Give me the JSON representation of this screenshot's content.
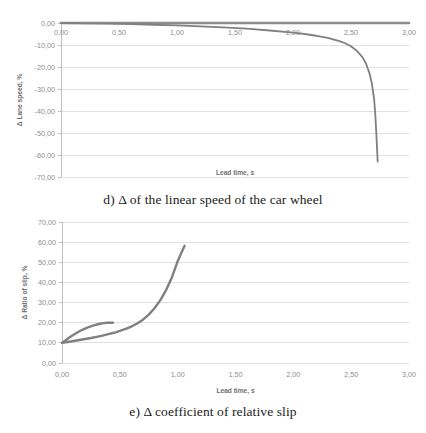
{
  "figures": [
    {
      "id": "d",
      "caption": "d) Δ of the linear speed of the car wheel",
      "chart_data": {
        "type": "line",
        "title": "",
        "xlabel": "Lead time, s",
        "ylabel": "Δ Lane speed, %",
        "xlim": [
          0.0,
          3.0
        ],
        "ylim": [
          -70.0,
          0.0
        ],
        "xticks": [
          "0,00",
          "0,50",
          "1,00",
          "1,50",
          "2,00",
          "2,50",
          "3,00"
        ],
        "xtick_values": [
          0.0,
          0.5,
          1.0,
          1.5,
          2.0,
          2.5,
          3.0
        ],
        "yticks": [
          "0,00",
          "-10,00",
          "-20,00",
          "-30,00",
          "-40,00",
          "-50,00",
          "-60,00",
          "-70,00"
        ],
        "ytick_values": [
          0,
          -10,
          -20,
          -30,
          -40,
          -50,
          -60,
          -70
        ],
        "grid": true,
        "legend": "none",
        "series": [
          {
            "name": "reference",
            "color": "#8c8c8c",
            "width": 2.6,
            "x": [
              0.0,
              0.5,
              1.0,
              1.5,
              2.0,
              2.5,
              3.0
            ],
            "values": [
              0.0,
              0.0,
              0.0,
              0.0,
              0.0,
              0.0,
              0.0
            ]
          },
          {
            "name": "wheel linear speed delta",
            "color": "#808080",
            "width": 1.8,
            "x": [
              0.0,
              0.2,
              0.4,
              0.6,
              0.8,
              1.0,
              1.2,
              1.4,
              1.6,
              1.8,
              2.0,
              2.1,
              2.2,
              2.3,
              2.4,
              2.45,
              2.5,
              2.55,
              2.6,
              2.63,
              2.66,
              2.68,
              2.7,
              2.71,
              2.72,
              2.73
            ],
            "values": [
              -0.1,
              -0.2,
              -0.3,
              -0.5,
              -0.8,
              -1.1,
              -1.5,
              -2.0,
              -2.6,
              -3.4,
              -4.4,
              -5.0,
              -5.8,
              -6.8,
              -8.2,
              -9.2,
              -10.6,
              -12.6,
              -15.6,
              -18.5,
              -23.0,
              -27.5,
              -35.0,
              -42.0,
              -52.0,
              -63.0
            ]
          }
        ]
      }
    },
    {
      "id": "e",
      "caption": "e) Δ coefficient of relative slip",
      "chart_data": {
        "type": "line",
        "title": "",
        "xlabel": "Lead time, s",
        "ylabel": "Δ Ratio of slip, %",
        "xlim": [
          0.0,
          3.0
        ],
        "ylim": [
          0.0,
          70.0
        ],
        "xticks": [
          "0,00",
          "0,50",
          "1,00",
          "1,50",
          "2,00",
          "2,50",
          "3,00"
        ],
        "xtick_values": [
          0.0,
          0.5,
          1.0,
          1.5,
          2.0,
          2.5,
          3.0
        ],
        "yticks": [
          "0,00",
          "10,00",
          "20,00",
          "30,00",
          "40,00",
          "50,00",
          "60,00",
          "70,00"
        ],
        "ytick_values": [
          0,
          10,
          20,
          30,
          40,
          50,
          60,
          70
        ],
        "grid": true,
        "legend": "none",
        "series": [
          {
            "name": "upper branch",
            "color": "#808080",
            "width": 2.4,
            "x": [
              0.0,
              0.03,
              0.06,
              0.1,
              0.14,
              0.18,
              0.22,
              0.26,
              0.3,
              0.33,
              0.36,
              0.39,
              0.42,
              0.44
            ],
            "values": [
              10.0,
              11.2,
              12.5,
              14.0,
              15.4,
              16.6,
              17.6,
              18.4,
              19.1,
              19.5,
              19.8,
              19.95,
              20.0,
              20.0
            ]
          },
          {
            "name": "lower branch",
            "color": "#808080",
            "width": 2.4,
            "x": [
              0.0,
              0.05,
              0.1,
              0.15,
              0.2,
              0.25,
              0.3,
              0.35,
              0.4,
              0.45,
              0.5,
              0.55,
              0.6,
              0.65,
              0.7,
              0.75,
              0.8,
              0.85,
              0.9,
              0.95,
              1.0,
              1.03,
              1.06
            ],
            "values": [
              10.0,
              10.4,
              10.9,
              11.4,
              11.9,
              12.4,
              13.0,
              13.6,
              14.3,
              15.0,
              15.9,
              16.9,
              18.1,
              19.6,
              21.5,
              24.0,
              27.2,
              31.2,
              36.2,
              42.5,
              50.5,
              54.5,
              58.2
            ]
          }
        ]
      }
    }
  ],
  "colors": {
    "grid": "#d9d9d9",
    "axis": "#bfbfbf",
    "line": "#808080",
    "tick_text": "#8d8d8d",
    "caption_text": "#1b1b1b"
  }
}
